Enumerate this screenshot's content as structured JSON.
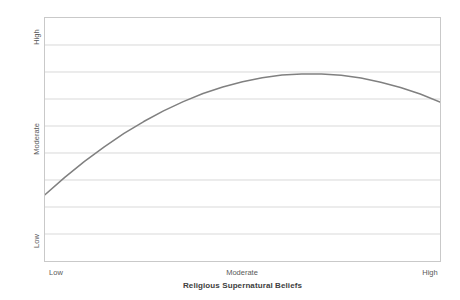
{
  "chart_data": {
    "type": "line",
    "title": "",
    "subtitle": "",
    "xlabel": "Religious Supernatural Beliefs",
    "ylabel": "Paranormal Beliefs",
    "x_tick_labels": [
      "Low",
      "Moderate",
      "High"
    ],
    "y_tick_labels": [
      "Low",
      "Moderate",
      "High"
    ],
    "xlim": [
      0,
      100
    ],
    "ylim": [
      0,
      100
    ],
    "grid": "horizontal",
    "legend": "none",
    "annotations": [],
    "series": [
      {
        "name": "Paranormal Beliefs",
        "color": "#808080",
        "line_width": 1.5,
        "shape": "inverted-u",
        "x": [
          0,
          5,
          10,
          15,
          20,
          25,
          30,
          35,
          40,
          45,
          50,
          55,
          60,
          65,
          70,
          75,
          80,
          85,
          90,
          95,
          100
        ],
        "y": [
          27.3,
          34.4,
          41.0,
          47.0,
          52.5,
          57.4,
          61.8,
          65.6,
          68.9,
          71.6,
          73.8,
          75.4,
          76.5,
          77.0,
          77.0,
          76.4,
          75.3,
          73.6,
          71.4,
          68.7,
          65.4
        ]
      }
    ]
  },
  "axes": {
    "y_title": "Paranormal Beliefs",
    "y_ticks": {
      "high": "High",
      "moderate": "Moderate",
      "low": "Low"
    },
    "x_title": "Religious Supernatural Beliefs",
    "x_ticks": {
      "low": "Low",
      "moderate": "Moderate",
      "high": "High"
    }
  },
  "colors": {
    "curve": "#808080",
    "gridline": "#d9d9d9",
    "plot_border": "#c9c9c9",
    "text": "#595959",
    "title_text": "#404040",
    "background": "#ffffff"
  }
}
